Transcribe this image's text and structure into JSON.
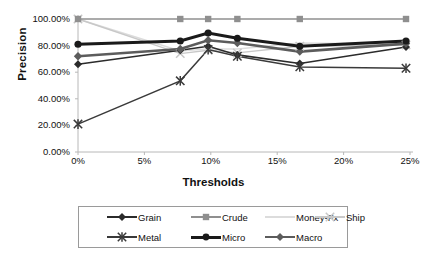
{
  "chart_data": {
    "type": "line",
    "title": "",
    "xlabel": "Thresholds",
    "ylabel": "Precision",
    "xlim": [
      0,
      25
    ],
    "ylim": [
      0,
      100
    ],
    "x_ticklabels": [
      "0%",
      "5%",
      "10%",
      "15%",
      "20%",
      "25%"
    ],
    "x_tickvalues": [
      0,
      5,
      10,
      15,
      20,
      25
    ],
    "y_ticklabels": [
      "0.00%",
      "20.00%",
      "40.00%",
      "60.00%",
      "80.00%",
      "100.00%"
    ],
    "y_tickvalues": [
      0,
      20,
      40,
      60,
      80,
      100
    ],
    "grid": false,
    "legend_position": "bottom",
    "x": [
      0,
      7.7,
      9.8,
      12.0,
      16.7,
      24.7
    ],
    "series": [
      {
        "name": "Grain",
        "marker": "diamond",
        "color": "#2b2b2b",
        "width": 1.6,
        "values": [
          66.0,
          76.5,
          79.5,
          73.0,
          66.5,
          79.0
        ]
      },
      {
        "name": "Crude",
        "marker": "square",
        "color": "#8f8f8f",
        "width": 1.4,
        "values": [
          100.0,
          100.0,
          100.0,
          100.0,
          100.0,
          100.0
        ]
      },
      {
        "name": "Money-Fx",
        "marker": "none",
        "color": "#dcdcdc",
        "width": 1.4,
        "values": [
          100.0,
          76.0,
          77.5,
          77.5,
          82.0,
          81.0
        ]
      },
      {
        "name": "Ship",
        "marker": "cross",
        "color": "#c8c8c8",
        "width": 1.4,
        "values": [
          100.0,
          74.0,
          76.5,
          74.5,
          79.5,
          80.5
        ]
      },
      {
        "name": "Metal",
        "marker": "asterisk",
        "color": "#3a3a3a",
        "width": 1.5,
        "values": [
          21.0,
          53.5,
          77.0,
          72.0,
          64.0,
          63.0
        ]
      },
      {
        "name": "Micro",
        "marker": "circle",
        "color": "#1a1a1a",
        "width": 3.0,
        "values": [
          81.0,
          83.5,
          89.5,
          85.5,
          79.5,
          83.5
        ]
      },
      {
        "name": "Macro",
        "marker": "diamond",
        "color": "#5c5c5c",
        "width": 2.6,
        "values": [
          72.0,
          77.5,
          84.0,
          82.0,
          75.5,
          81.5
        ]
      }
    ]
  },
  "axes": {
    "ylabel": "Precision",
    "xlabel": "Thresholds"
  },
  "legend": {
    "rows": [
      [
        "Grain",
        "Crude",
        "Money-Fx",
        "Ship"
      ],
      [
        "Metal",
        "Micro",
        "Macro"
      ]
    ]
  },
  "caption": ""
}
